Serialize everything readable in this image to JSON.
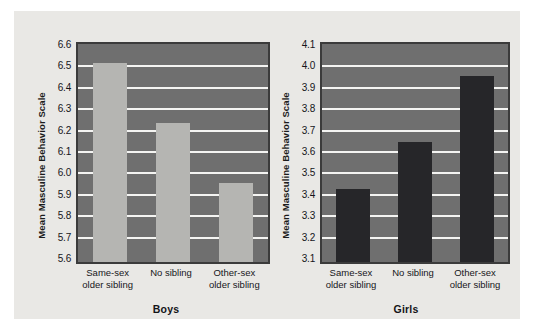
{
  "figure": {
    "background_color": "#e9e8e5",
    "page_background_color": "#ffffff"
  },
  "chart_data": [
    {
      "type": "bar",
      "title": "Boys",
      "xlabel": "",
      "ylabel": "Mean Masculine Behavior Scale",
      "categories": [
        "Same-sex older sibling",
        "No sibling",
        "Other-sex older sibling"
      ],
      "values": [
        6.53,
        6.25,
        5.97
      ],
      "ylim": [
        5.6,
        6.6
      ],
      "ytick_step": 0.1,
      "yticks": [
        "6.6",
        "6.5",
        "6.4",
        "6.3",
        "6.2",
        "6.1",
        "6.0",
        "5.9",
        "5.8",
        "5.7",
        "5.6"
      ],
      "grid": true,
      "legend": "none",
      "bar_color": "#b5b5b2",
      "plot_background_color": "#6f6f6f",
      "gridline_color": "#f4f4f2"
    },
    {
      "type": "bar",
      "title": "Girls",
      "xlabel": "",
      "ylabel": "Mean Masculine Behavior Scale",
      "categories": [
        "Same-sex older sibling",
        "No sibling",
        "Other-sex older sibling"
      ],
      "values": [
        3.44,
        3.66,
        3.97
      ],
      "ylim": [
        3.1,
        4.1
      ],
      "ytick_step": 0.1,
      "yticks": [
        "4.1",
        "4.0",
        "3.9",
        "3.8",
        "3.7",
        "3.6",
        "3.5",
        "3.4",
        "3.3",
        "3.2",
        "3.1"
      ],
      "grid": true,
      "legend": "none",
      "bar_color": "#262629",
      "plot_background_color": "#6f6f6f",
      "gridline_color": "#f4f4f2"
    }
  ]
}
